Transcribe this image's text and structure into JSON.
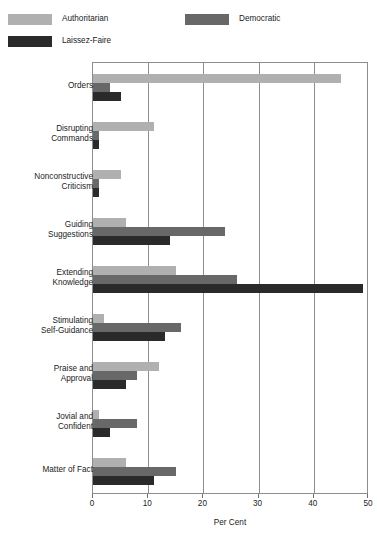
{
  "chart_data": {
    "type": "bar",
    "orientation": "horizontal",
    "grouped": true,
    "title": "",
    "xlabel": "Per Cent",
    "ylabel": "",
    "xlim": [
      0,
      50
    ],
    "xticks": [
      0,
      10,
      20,
      30,
      40,
      50
    ],
    "grid": "vertical",
    "legend_position": "top-left",
    "categories": [
      "Orders",
      "Disrupting Commands",
      "Nonconstructive Criticism",
      "Guiding Suggestions",
      "Extending Knowledge",
      "Stimulating Self-Guidance",
      "Praise and Approval",
      "Jovial and Confident",
      "Matter of Fact"
    ],
    "category_lines": [
      [
        "Orders",
        ""
      ],
      [
        "Disrupting",
        "Commands"
      ],
      [
        "Nonconstructive",
        "Criticism"
      ],
      [
        "Guiding",
        "Suggestions"
      ],
      [
        "Extending",
        "Knowledge"
      ],
      [
        "Stimulating",
        "Self-Guidance"
      ],
      [
        "Praise and",
        "Approval"
      ],
      [
        "Jovial and",
        "Confident"
      ],
      [
        "Matter of Fact",
        ""
      ]
    ],
    "series": [
      {
        "name": "Authoritarian",
        "color": "#b0b0b0",
        "values": [
          45,
          11,
          5,
          6,
          15,
          2,
          12,
          1,
          6
        ]
      },
      {
        "name": "Democratic",
        "color": "#686868",
        "values": [
          3,
          1,
          1,
          24,
          26,
          16,
          8,
          8,
          15
        ]
      },
      {
        "name": "Laissez-Faire",
        "color": "#2a2a2a",
        "values": [
          5,
          1,
          1,
          14,
          49,
          13,
          6,
          3,
          11
        ]
      }
    ]
  },
  "legend": {
    "entries": [
      {
        "label": "Authoritarian",
        "color": "#b0b0b0"
      },
      {
        "label": "Democratic",
        "color": "#686868"
      },
      {
        "label": "Laissez-Faire",
        "color": "#2a2a2a"
      }
    ]
  },
  "axis": {
    "x_title": "Per Cent",
    "x_tick_labels": [
      "0",
      "10",
      "20",
      "30",
      "40",
      "50"
    ]
  }
}
